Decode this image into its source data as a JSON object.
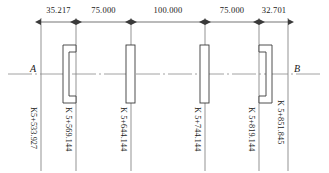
{
  "drawing": {
    "title": "Bridge span layout longitudinal profile",
    "endpoint_labels": {
      "left": "A",
      "right": "B"
    },
    "colors": {
      "line": "#3a3a3a",
      "centerline": "#8a8a8a",
      "text": "#1a1a1a",
      "background": "#ffffff"
    },
    "dimensions": [
      {
        "id": "d1",
        "label": "35.217",
        "from_x": 41,
        "to_x": 76
      },
      {
        "id": "d2",
        "label": "75.000",
        "from_x": 76,
        "to_x": 131
      },
      {
        "id": "d3",
        "label": "100.000",
        "from_x": 131,
        "to_x": 205
      },
      {
        "id": "d4",
        "label": "75.000",
        "from_x": 205,
        "to_x": 259
      },
      {
        "id": "d5",
        "label": "32.701",
        "from_x": 259,
        "to_x": 288
      }
    ],
    "stations": [
      {
        "id": "s1",
        "label": "K5+533.927",
        "x": 41,
        "type": "start-station"
      },
      {
        "id": "s2",
        "label": "K 5+569.144",
        "x": 76,
        "type": "pier-station"
      },
      {
        "id": "s3",
        "label": "K 5+644.144",
        "x": 131,
        "type": "pier-station"
      },
      {
        "id": "s4",
        "label": "K 5+744.144",
        "x": 205,
        "type": "pier-station"
      },
      {
        "id": "s5",
        "label": "K 5+819.144",
        "x": 259,
        "type": "pier-station"
      },
      {
        "id": "s6",
        "label": "K 5+851.845",
        "x": 288,
        "type": "end-station"
      }
    ],
    "supports": [
      {
        "id": "p1",
        "kind": "abutment-left",
        "x": 76
      },
      {
        "id": "p2",
        "kind": "pier",
        "x": 131
      },
      {
        "id": "p3",
        "kind": "pier",
        "x": 205
      },
      {
        "id": "p4",
        "kind": "abutment-right",
        "x": 259
      }
    ],
    "axis": {
      "y": 74,
      "x_start": 8,
      "x_end": 322
    }
  }
}
